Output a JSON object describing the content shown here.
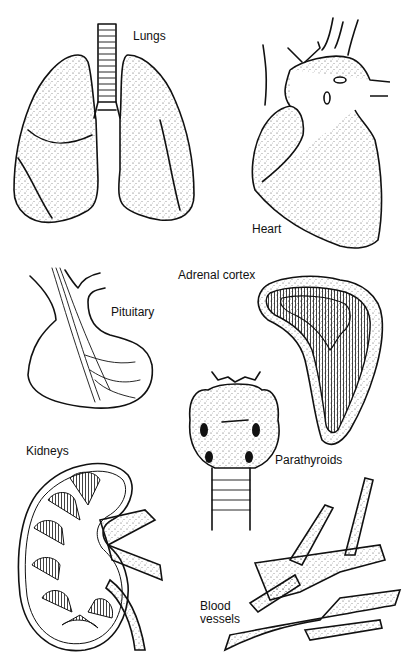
{
  "figure": {
    "type": "anatomical illustration",
    "background": "#ffffff",
    "ink_color": "#111111"
  },
  "labels": {
    "lungs": "Lungs",
    "heart": "Heart",
    "pituitary": "Pituitary",
    "adrenal_cortex": "Adrenal cortex",
    "parathyroids": "Parathyroids",
    "kidneys": "Kidneys",
    "blood_vessels_line1": "Blood",
    "blood_vessels_line2": "vessels"
  },
  "organs": [
    "Lungs",
    "Heart",
    "Pituitary",
    "Adrenal cortex",
    "Parathyroids",
    "Kidneys",
    "Blood vessels"
  ]
}
